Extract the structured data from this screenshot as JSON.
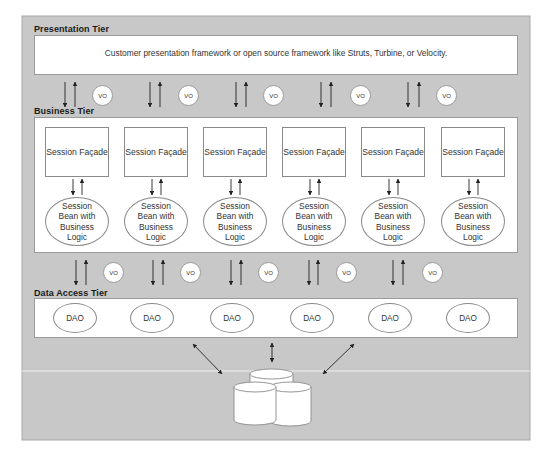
{
  "colors": {
    "page_background": "#ffffff",
    "panel_background": "#c8c8c8",
    "tier_box_background": "#ffffff",
    "stroke": "#8a8a8a",
    "arrow": "#222222",
    "divider_line": "#f2f2f2"
  },
  "presentation_tier": {
    "label": "Presentation Tier",
    "description": "Customer presentation framework or open source framework like Struts, Turbine, or Velocity."
  },
  "presentation_to_business_links": [
    {
      "vo": "VO"
    },
    {
      "vo": "VO"
    },
    {
      "vo": "VO"
    },
    {
      "vo": "VO"
    },
    {
      "vo": "VO"
    }
  ],
  "business_tier": {
    "label": "Business Tier",
    "columns": [
      {
        "facade": "Session Façade",
        "bean": "Session Bean with Business Logic"
      },
      {
        "facade": "Session Façade",
        "bean": "Session Bean with Business Logic"
      },
      {
        "facade": "Session Façade",
        "bean": "Session Bean with Business Logic"
      },
      {
        "facade": "Session Façade",
        "bean": "Session Bean with Business Logic"
      },
      {
        "facade": "Session Façade",
        "bean": "Session Bean with Business Logic"
      },
      {
        "facade": "Session Façade",
        "bean": "Session Bean with Business Logic"
      }
    ],
    "bean_lines": [
      "Session",
      "Bean with",
      "Business",
      "Logic"
    ]
  },
  "business_to_data_links": [
    {
      "vo": "VO"
    },
    {
      "vo": "VO"
    },
    {
      "vo": "VO"
    },
    {
      "vo": "VO"
    },
    {
      "vo": "VO"
    }
  ],
  "data_access_tier": {
    "label": "Data Access Tier",
    "daos": [
      "DAO",
      "DAO",
      "DAO",
      "DAO",
      "DAO",
      "DAO"
    ]
  },
  "data_store": {
    "icon": "database-cylinders-icon",
    "cylinder_count": 3,
    "connections": [
      "left-diagonal",
      "center-vertical",
      "right-diagonal"
    ]
  }
}
